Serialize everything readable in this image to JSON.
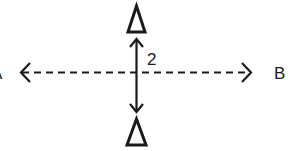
{
  "diagram": {
    "labels": {
      "left_point": "A",
      "right_point": "B",
      "distance": "2"
    },
    "elements": {
      "top_marker": "triangle",
      "bottom_marker": "triangle",
      "horizontal_line": "dashed double-headed arrow from A to B",
      "vertical_line": "solid double-headed arrow between triangles"
    },
    "colors": {
      "stroke": "#1a1a1a",
      "background": "#ffffff"
    }
  }
}
